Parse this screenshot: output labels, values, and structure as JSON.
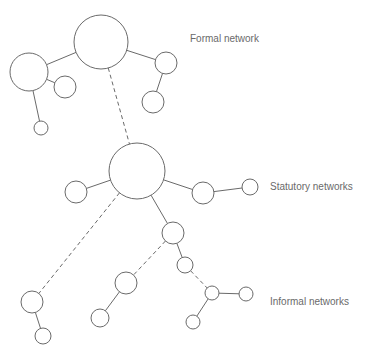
{
  "labels": {
    "formal": "Formal network",
    "statutory": "Statutory networks",
    "informal": "Informal networks"
  },
  "colors": {
    "stroke": "#6a6a6a",
    "text": "#6a6a6a",
    "background": "#ffffff"
  },
  "nodes": [
    {
      "id": "formal-main",
      "cx": 101,
      "cy": 42,
      "r": 27
    },
    {
      "id": "formal-left",
      "cx": 29,
      "cy": 72,
      "r": 19
    },
    {
      "id": "formal-left-child",
      "cx": 65,
      "cy": 87,
      "r": 11
    },
    {
      "id": "formal-left-lower",
      "cx": 41,
      "cy": 128,
      "r": 7
    },
    {
      "id": "formal-right",
      "cx": 166,
      "cy": 63,
      "r": 11
    },
    {
      "id": "formal-right-lower",
      "cx": 153,
      "cy": 102,
      "r": 11
    },
    {
      "id": "statutory-main",
      "cx": 137,
      "cy": 171,
      "r": 28
    },
    {
      "id": "statutory-left",
      "cx": 76,
      "cy": 192,
      "r": 11
    },
    {
      "id": "statutory-right",
      "cx": 203,
      "cy": 193,
      "r": 11
    },
    {
      "id": "statutory-far-right",
      "cx": 250,
      "cy": 187,
      "r": 8
    },
    {
      "id": "statutory-down",
      "cx": 173,
      "cy": 233,
      "r": 11
    },
    {
      "id": "statutory-down-2",
      "cx": 185,
      "cy": 265,
      "r": 8
    },
    {
      "id": "informal-hub",
      "cx": 212,
      "cy": 293,
      "r": 7
    },
    {
      "id": "informal-hub-right",
      "cx": 246,
      "cy": 294,
      "r": 7
    },
    {
      "id": "informal-hub-down",
      "cx": 193,
      "cy": 322,
      "r": 7
    },
    {
      "id": "informal-left",
      "cx": 32,
      "cy": 302,
      "r": 11
    },
    {
      "id": "informal-left-child",
      "cx": 43,
      "cy": 336,
      "r": 8
    },
    {
      "id": "informal-mid",
      "cx": 126,
      "cy": 283,
      "r": 11
    },
    {
      "id": "informal-mid-child",
      "cx": 100,
      "cy": 318,
      "r": 9
    }
  ],
  "edges": [
    {
      "from": "formal-main",
      "to": "formal-left",
      "style": "solid"
    },
    {
      "from": "formal-left",
      "to": "formal-left-child",
      "style": "solid"
    },
    {
      "from": "formal-left",
      "to": "formal-left-lower",
      "style": "solid"
    },
    {
      "from": "formal-main",
      "to": "formal-right",
      "style": "solid"
    },
    {
      "from": "formal-right",
      "to": "formal-right-lower",
      "style": "solid"
    },
    {
      "from": "formal-main",
      "to": "statutory-main",
      "style": "dashed"
    },
    {
      "from": "statutory-main",
      "to": "statutory-left",
      "style": "solid"
    },
    {
      "from": "statutory-main",
      "to": "statutory-right",
      "style": "solid"
    },
    {
      "from": "statutory-right",
      "to": "statutory-far-right",
      "style": "solid"
    },
    {
      "from": "statutory-main",
      "to": "statutory-down",
      "style": "solid"
    },
    {
      "from": "statutory-down",
      "to": "statutory-down-2",
      "style": "solid"
    },
    {
      "from": "statutory-down-2",
      "to": "informal-hub",
      "style": "dashed"
    },
    {
      "from": "informal-hub",
      "to": "informal-hub-right",
      "style": "solid"
    },
    {
      "from": "informal-hub",
      "to": "informal-hub-down",
      "style": "solid"
    },
    {
      "from": "statutory-main",
      "to": "informal-left",
      "style": "dashed"
    },
    {
      "from": "informal-left",
      "to": "informal-left-child",
      "style": "solid"
    },
    {
      "from": "statutory-down",
      "to": "informal-mid",
      "style": "dashed"
    },
    {
      "from": "informal-mid",
      "to": "informal-mid-child",
      "style": "solid"
    }
  ]
}
